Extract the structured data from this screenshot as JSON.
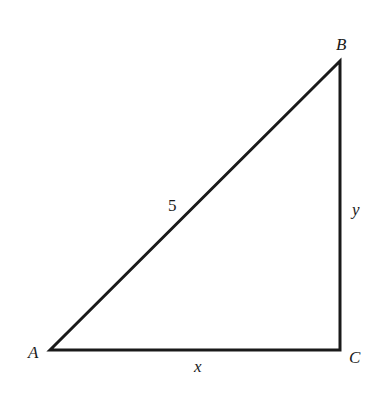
{
  "diagram": {
    "type": "right-triangle",
    "stroke_color": "#1a1a1a",
    "background": "#ffffff",
    "vertices": {
      "A": {
        "label": "A",
        "x": 50,
        "y": 350
      },
      "B": {
        "label": "B",
        "x": 340,
        "y": 61
      },
      "C": {
        "label": "C",
        "x": 340,
        "y": 350
      }
    },
    "sides": {
      "AB": {
        "label": "5"
      },
      "BC": {
        "label": "y"
      },
      "AC": {
        "label": "x"
      }
    },
    "right_angle_at": "C"
  }
}
